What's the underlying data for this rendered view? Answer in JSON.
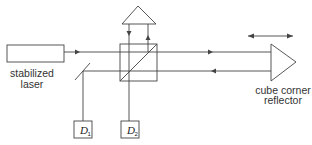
{
  "diagram": {
    "colors": {
      "stroke": "#444444",
      "text": "#333333",
      "background": "#ffffff"
    },
    "components": {
      "laser": {
        "label_line1": "stabilized",
        "label_line2": "laser"
      },
      "reflector": {
        "label_line1": "cube corner",
        "label_line2": "reflector"
      },
      "detector1": {
        "symbol": "D",
        "subscript": "1"
      },
      "detector2": {
        "symbol": "D",
        "subscript": "2"
      },
      "beam_splitter": {
        "type": "cube beam splitter"
      },
      "reference_reflector": {
        "type": "fixed corner reflector (top)"
      },
      "pickoff_mirror": {
        "type": "partial mirror"
      },
      "motion_indicator": {
        "type": "double-headed arrow"
      }
    }
  }
}
